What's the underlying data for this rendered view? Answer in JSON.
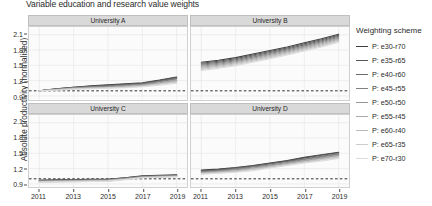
{
  "chart_data": {
    "type": "line",
    "title": "Variable education and research value weights",
    "xlabel": "",
    "ylabel": "Absolute productivity (normalised)",
    "ylim": [
      0.83,
      2.25
    ],
    "xlim": [
      2010.4,
      2019.6
    ],
    "grid": true,
    "legend_position": "right",
    "legend_title": "Weighting scheme",
    "y_ticks": [
      0.9,
      1.2,
      1.5,
      1.8,
      2.1
    ],
    "y_tick_labels": [
      "0.9",
      "1.2",
      "1.5",
      "1.8",
      "2.1"
    ],
    "x_ticks": [
      2011,
      2013,
      2015,
      2017,
      2019
    ],
    "x_tick_labels": [
      "2011",
      "2013",
      "2015",
      "2017",
      "2019"
    ],
    "reference_line": {
      "y": 1.0,
      "style": "dashed",
      "color": "#1a1a1a"
    },
    "facets": [
      "University A",
      "University B",
      "University C",
      "University D"
    ],
    "x": [
      2011,
      2012,
      2013,
      2014,
      2015,
      2016,
      2017,
      2018,
      2019
    ],
    "series_names": [
      "P: e30-r70",
      "P: e35-r65",
      "P: e40-r60",
      "P: e45-r55",
      "P: e50-r50",
      "P: e55-r45",
      "P: e60-r40",
      "P: e65-r35",
      "P: e70-r30"
    ],
    "series_colors": [
      "#3f3f3f",
      "#555555",
      "#6b6b6b",
      "#808080",
      "#959595",
      "#a8a8a8",
      "#bababa",
      "#cbcbcb",
      "#dcdcdc"
    ],
    "panels": [
      {
        "name": "University A",
        "series": [
          {
            "name": "P: e30-r70",
            "values": [
              1.0,
              1.04,
              1.07,
              1.1,
              1.12,
              1.14,
              1.16,
              1.21,
              1.27
            ]
          },
          {
            "name": "P: e35-r65",
            "values": [
              1.0,
              1.04,
              1.07,
              1.09,
              1.11,
              1.13,
              1.15,
              1.2,
              1.26
            ]
          },
          {
            "name": "P: e40-r60",
            "values": [
              1.0,
              1.03,
              1.06,
              1.08,
              1.1,
              1.12,
              1.14,
              1.19,
              1.24
            ]
          },
          {
            "name": "P: e45-r55",
            "values": [
              1.0,
              1.03,
              1.06,
              1.08,
              1.09,
              1.11,
              1.13,
              1.18,
              1.23
            ]
          },
          {
            "name": "P: e50-r50",
            "values": [
              1.0,
              1.03,
              1.05,
              1.07,
              1.08,
              1.1,
              1.12,
              1.16,
              1.21
            ]
          },
          {
            "name": "P: e55-r45",
            "values": [
              1.0,
              1.02,
              1.05,
              1.06,
              1.07,
              1.09,
              1.11,
              1.15,
              1.2
            ]
          },
          {
            "name": "P: e60-r40",
            "values": [
              1.0,
              1.02,
              1.04,
              1.05,
              1.06,
              1.08,
              1.1,
              1.14,
              1.18
            ]
          },
          {
            "name": "P: e65-r35",
            "values": [
              1.0,
              1.02,
              1.04,
              1.05,
              1.06,
              1.07,
              1.09,
              1.13,
              1.17
            ]
          },
          {
            "name": "P: e70-r30",
            "values": [
              1.0,
              1.01,
              1.03,
              1.04,
              1.05,
              1.06,
              1.08,
              1.11,
              1.15
            ]
          }
        ]
      },
      {
        "name": "University B",
        "series": [
          {
            "name": "P: e30-r70",
            "values": [
              1.56,
              1.6,
              1.65,
              1.72,
              1.79,
              1.86,
              1.94,
              2.02,
              2.11
            ]
          },
          {
            "name": "P: e35-r65",
            "values": [
              1.54,
              1.58,
              1.63,
              1.7,
              1.77,
              1.84,
              1.92,
              2.0,
              2.09
            ]
          },
          {
            "name": "P: e40-r60",
            "values": [
              1.52,
              1.56,
              1.61,
              1.68,
              1.75,
              1.82,
              1.9,
              1.98,
              2.07
            ]
          },
          {
            "name": "P: e45-r55",
            "values": [
              1.5,
              1.54,
              1.59,
              1.66,
              1.73,
              1.8,
              1.88,
              1.96,
              2.05
            ]
          },
          {
            "name": "P: e50-r50",
            "values": [
              1.48,
              1.52,
              1.57,
              1.64,
              1.71,
              1.78,
              1.86,
              1.94,
              2.03
            ]
          },
          {
            "name": "P: e55-r45",
            "values": [
              1.46,
              1.5,
              1.55,
              1.62,
              1.69,
              1.76,
              1.84,
              1.92,
              2.01
            ]
          },
          {
            "name": "P: e60-r40",
            "values": [
              1.44,
              1.48,
              1.53,
              1.6,
              1.67,
              1.74,
              1.82,
              1.9,
              1.99
            ]
          },
          {
            "name": "P: e65-r35",
            "values": [
              1.42,
              1.46,
              1.51,
              1.58,
              1.65,
              1.72,
              1.8,
              1.88,
              1.97
            ]
          },
          {
            "name": "P: e70-r30",
            "values": [
              1.4,
              1.44,
              1.49,
              1.56,
              1.63,
              1.7,
              1.78,
              1.86,
              1.95
            ]
          }
        ]
      },
      {
        "name": "University C",
        "series": [
          {
            "name": "P: e30-r70",
            "values": [
              0.97,
              0.98,
              0.98,
              0.99,
              0.99,
              1.02,
              1.06,
              1.07,
              1.08
            ]
          },
          {
            "name": "P: e35-r65",
            "values": [
              0.97,
              0.97,
              0.98,
              0.98,
              0.99,
              1.02,
              1.05,
              1.06,
              1.07
            ]
          },
          {
            "name": "P: e40-r60",
            "values": [
              0.96,
              0.97,
              0.97,
              0.98,
              0.98,
              1.01,
              1.05,
              1.06,
              1.07
            ]
          },
          {
            "name": "P: e45-r55",
            "values": [
              0.96,
              0.96,
              0.97,
              0.97,
              0.98,
              1.01,
              1.04,
              1.05,
              1.06
            ]
          },
          {
            "name": "P: e50-r50",
            "values": [
              0.95,
              0.96,
              0.96,
              0.97,
              0.97,
              1.0,
              1.04,
              1.05,
              1.06
            ]
          },
          {
            "name": "P: e55-r45",
            "values": [
              0.95,
              0.95,
              0.96,
              0.96,
              0.97,
              1.0,
              1.03,
              1.04,
              1.05
            ]
          },
          {
            "name": "P: e60-r40",
            "values": [
              0.94,
              0.95,
              0.95,
              0.96,
              0.96,
              0.99,
              1.03,
              1.04,
              1.05
            ]
          },
          {
            "name": "P: e65-r35",
            "values": [
              0.94,
              0.94,
              0.95,
              0.95,
              0.96,
              0.99,
              1.02,
              1.03,
              1.04
            ]
          },
          {
            "name": "P: e70-r30",
            "values": [
              0.93,
              0.94,
              0.94,
              0.95,
              0.95,
              0.98,
              1.02,
              1.03,
              1.04
            ]
          }
        ]
      },
      {
        "name": "University D",
        "series": [
          {
            "name": "P: e30-r70",
            "values": [
              1.17,
              1.19,
              1.22,
              1.26,
              1.31,
              1.36,
              1.42,
              1.47,
              1.52
            ]
          },
          {
            "name": "P: e35-r65",
            "values": [
              1.16,
              1.18,
              1.21,
              1.25,
              1.3,
              1.35,
              1.41,
              1.46,
              1.51
            ]
          },
          {
            "name": "P: e40-r60",
            "values": [
              1.15,
              1.17,
              1.2,
              1.24,
              1.29,
              1.34,
              1.39,
              1.44,
              1.49
            ]
          },
          {
            "name": "P: e45-r55",
            "values": [
              1.14,
              1.16,
              1.19,
              1.23,
              1.27,
              1.32,
              1.38,
              1.43,
              1.48
            ]
          },
          {
            "name": "P: e50-r50",
            "values": [
              1.13,
              1.15,
              1.18,
              1.21,
              1.26,
              1.31,
              1.36,
              1.41,
              1.46
            ]
          },
          {
            "name": "P: e55-r45",
            "values": [
              1.12,
              1.14,
              1.16,
              1.2,
              1.25,
              1.3,
              1.35,
              1.4,
              1.45
            ]
          },
          {
            "name": "P: e60-r40",
            "values": [
              1.11,
              1.13,
              1.15,
              1.19,
              1.23,
              1.28,
              1.33,
              1.38,
              1.43
            ]
          },
          {
            "name": "P: e65-r35",
            "values": [
              1.1,
              1.12,
              1.14,
              1.18,
              1.22,
              1.27,
              1.32,
              1.37,
              1.42
            ]
          },
          {
            "name": "P: e70-r30",
            "values": [
              1.09,
              1.11,
              1.13,
              1.16,
              1.21,
              1.26,
              1.31,
              1.35,
              1.4
            ]
          }
        ]
      }
    ]
  }
}
